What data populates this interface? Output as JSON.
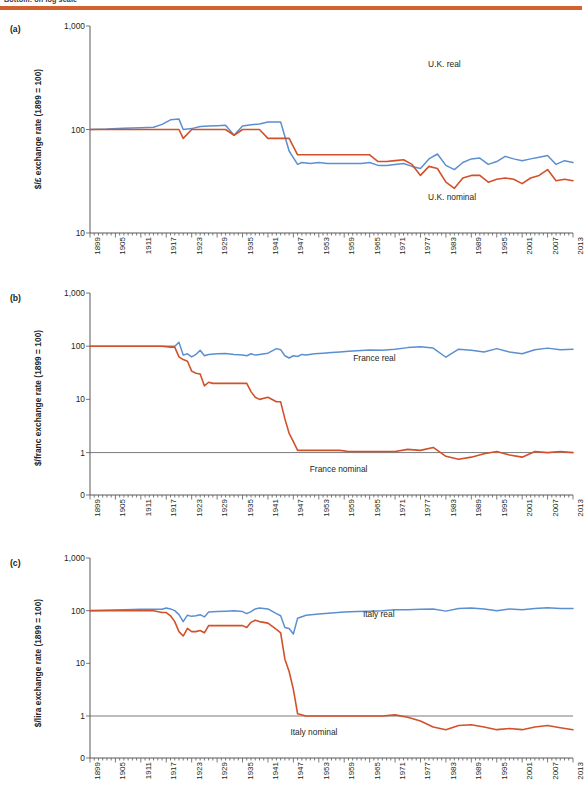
{
  "header": {
    "caption": "Bottom: on log scale",
    "rule_color": "#d2622f"
  },
  "colors": {
    "real": "#5b8fd0",
    "nominal": "#d2502a",
    "axis": "#58595b",
    "text": "#231f20"
  },
  "panels": [
    {
      "tag": "(a)",
      "ylabel": "$/£ exchange rate (1899 = 100)",
      "yticks": [
        "1,000",
        "100",
        "10"
      ],
      "real_label": "U.K. real",
      "nominal_label": "U.K. nominal"
    },
    {
      "tag": "(b)",
      "ylabel": "$/franc exchange rate (1899 = 100)",
      "yticks": [
        "1,000",
        "100",
        "10",
        "1",
        "0"
      ],
      "real_label": "France real",
      "nominal_label": "France nominal"
    },
    {
      "tag": "(c)",
      "ylabel": "$/lira exchange rate (1899 = 100)",
      "yticks": [
        "1,000",
        "100",
        "10",
        "1",
        "0"
      ],
      "real_label": "Italy real",
      "nominal_label": "Italy nominal"
    }
  ],
  "xticks": [
    "1899",
    "1905",
    "1911",
    "1917",
    "1923",
    "1929",
    "1935",
    "1941",
    "1947",
    "1953",
    "1959",
    "1965",
    "1971",
    "1977",
    "1983",
    "1989",
    "1995",
    "2001",
    "2007",
    "2013"
  ],
  "chart_data": {
    "type": "line",
    "xlabel": "",
    "x_start": 1899,
    "x_end": 2013,
    "x_tick_step": 6,
    "grid": false,
    "legend": "inline annotations",
    "panels": [
      {
        "id": "a",
        "tag": "(a)",
        "ylabel": "$/£ exchange rate (1899 = 100)",
        "yscale": "log",
        "yticks": [
          10,
          100,
          1000
        ],
        "ylim": [
          10,
          1000
        ],
        "series": [
          {
            "name": "U.K. real",
            "color": "#5b8fd0",
            "x": [
              1899,
              1903,
              1907,
              1911,
              1914,
              1916,
              1918,
              1920,
              1921,
              1923,
              1925,
              1927,
              1929,
              1931,
              1933,
              1935,
              1937,
              1939,
              1941,
              1944,
              1946,
              1948,
              1949,
              1951,
              1953,
              1955,
              1957,
              1959,
              1961,
              1963,
              1965,
              1967,
              1969,
              1971,
              1973,
              1975,
              1977,
              1979,
              1981,
              1983,
              1985,
              1987,
              1989,
              1991,
              1993,
              1995,
              1997,
              1999,
              2001,
              2003,
              2005,
              2007,
              2009,
              2011,
              2013
            ],
            "values": [
              100,
              101,
              103,
              104,
              105,
              112,
              124,
              126,
              100,
              102,
              107,
              108,
              109,
              110,
              88,
              108,
              111,
              113,
              118,
              118,
              62,
              46,
              48,
              47,
              48,
              47,
              47,
              47,
              47,
              47,
              48,
              45,
              45,
              46,
              47,
              44,
              42,
              52,
              58,
              45,
              41,
              48,
              52,
              53,
              46,
              49,
              55,
              52,
              50,
              52,
              54,
              56,
              46,
              50,
              48
            ]
          },
          {
            "name": "U.K. nominal",
            "color": "#d2502a",
            "x": [
              1899,
              1903,
              1907,
              1911,
              1914,
              1916,
              1918,
              1920,
              1921,
              1923,
              1925,
              1927,
              1929,
              1931,
              1933,
              1935,
              1937,
              1939,
              1941,
              1944,
              1946,
              1948,
              1949,
              1951,
              1953,
              1955,
              1957,
              1959,
              1961,
              1963,
              1965,
              1967,
              1969,
              1971,
              1973,
              1975,
              1977,
              1979,
              1981,
              1983,
              1985,
              1987,
              1989,
              1991,
              1993,
              1995,
              1997,
              1999,
              2001,
              2003,
              2005,
              2007,
              2009,
              2011,
              2013
            ],
            "values": [
              100,
              100,
              100,
              100,
              100,
              100,
              100,
              100,
              82,
              100,
              100,
              100,
              100,
              100,
              88,
              100,
              100,
              100,
              82,
              82,
              82,
              57,
              57,
              57,
              57,
              57,
              57,
              57,
              57,
              57,
              57,
              49,
              49,
              50,
              51,
              46,
              36,
              44,
              42,
              31,
              27,
              34,
              36,
              36,
              31,
              33,
              34,
              33,
              30,
              34,
              36,
              41,
              32,
              33,
              32
            ]
          }
        ]
      },
      {
        "id": "b",
        "tag": "(b)",
        "ylabel": "$/franc exchange rate (1899 = 100)",
        "yscale": "log",
        "yticks": [
          1,
          10,
          100,
          1000
        ],
        "ylim": [
          1,
          1000
        ],
        "series": [
          {
            "name": "France real",
            "color": "#5b8fd0",
            "x": [
              1899,
              1903,
              1907,
              1911,
              1914,
              1916,
              1918,
              1919,
              1920,
              1921,
              1922,
              1923,
              1924,
              1925,
              1926,
              1927,
              1929,
              1931,
              1933,
              1935,
              1936,
              1937,
              1938,
              1939,
              1941,
              1943,
              1944,
              1945,
              1946,
              1947,
              1948,
              1949,
              1950,
              1952,
              1954,
              1956,
              1958,
              1960,
              1962,
              1965,
              1968,
              1971,
              1974,
              1977,
              1980,
              1983,
              1986,
              1989,
              1992,
              1995,
              1998,
              2001,
              2004,
              2007,
              2010,
              2013
            ],
            "values": [
              100,
              100,
              100,
              100,
              100,
              100,
              100,
              100,
              118,
              68,
              72,
              63,
              70,
              84,
              66,
              70,
              72,
              73,
              70,
              68,
              66,
              72,
              68,
              70,
              74,
              90,
              86,
              66,
              60,
              66,
              64,
              70,
              68,
              72,
              74,
              76,
              78,
              80,
              82,
              85,
              84,
              88,
              94,
              98,
              92,
              62,
              88,
              84,
              78,
              90,
              78,
              72,
              86,
              92,
              86,
              88
            ]
          },
          {
            "name": "France nominal",
            "color": "#d2502a",
            "x": [
              1899,
              1903,
              1907,
              1911,
              1914,
              1916,
              1918,
              1919,
              1920,
              1921,
              1922,
              1923,
              1924,
              1925,
              1926,
              1927,
              1928,
              1929,
              1931,
              1933,
              1935,
              1936,
              1937,
              1938,
              1939,
              1941,
              1943,
              1944,
              1945,
              1946,
              1947,
              1948,
              1949,
              1950,
              1952,
              1954,
              1956,
              1958,
              1960,
              1962,
              1965,
              1968,
              1971,
              1974,
              1977,
              1980,
              1983,
              1986,
              1989,
              1992,
              1995,
              1998,
              2001,
              2004,
              2007,
              2010,
              2013
            ],
            "values": [
              100,
              100,
              100,
              100,
              100,
              100,
              96,
              96,
              63,
              56,
              52,
              34,
              31,
              30,
              18,
              21,
              20,
              20,
              20,
              20,
              20,
              20,
              14,
              11,
              10,
              11,
              9,
              9,
              4.3,
              2.3,
              1.6,
              1.1,
              1.1,
              1.1,
              1.1,
              1.1,
              1.1,
              1.1,
              1.05,
              1.05,
              1.05,
              1.05,
              1.05,
              1.15,
              1.1,
              1.25,
              0.85,
              0.75,
              0.82,
              0.95,
              1.05,
              0.9,
              0.82,
              1.05,
              1.0,
              1.05,
              1.0
            ]
          }
        ]
      },
      {
        "id": "c",
        "tag": "(c)",
        "ylabel": "$/lira exchange rate (1899 = 100)",
        "yscale": "log",
        "yticks": [
          1,
          10,
          100,
          1000
        ],
        "ylim": [
          1,
          1000
        ],
        "series": [
          {
            "name": "Italy real",
            "color": "#5b8fd0",
            "x": [
              1899,
              1903,
              1907,
              1911,
              1914,
              1916,
              1917,
              1918,
              1919,
              1920,
              1921,
              1922,
              1923,
              1924,
              1925,
              1926,
              1927,
              1929,
              1931,
              1933,
              1935,
              1936,
              1937,
              1938,
              1939,
              1941,
              1943,
              1944,
              1945,
              1946,
              1947,
              1948,
              1950,
              1953,
              1956,
              1959,
              1962,
              1965,
              1968,
              1971,
              1974,
              1977,
              1980,
              1983,
              1986,
              1989,
              1992,
              1995,
              1998,
              2001,
              2004,
              2007,
              2010,
              2013
            ],
            "values": [
              100,
              102,
              104,
              106,
              106,
              106,
              112,
              108,
              100,
              84,
              62,
              82,
              78,
              80,
              84,
              76,
              94,
              96,
              98,
              100,
              96,
              88,
              96,
              108,
              112,
              108,
              88,
              80,
              48,
              46,
              36,
              72,
              82,
              86,
              90,
              94,
              96,
              98,
              100,
              104,
              104,
              106,
              108,
              98,
              110,
              112,
              108,
              100,
              108,
              104,
              110,
              114,
              110,
              110
            ]
          },
          {
            "name": "Italy nominal",
            "color": "#d2502a",
            "x": [
              1899,
              1903,
              1907,
              1911,
              1914,
              1916,
              1917,
              1918,
              1919,
              1920,
              1921,
              1922,
              1923,
              1924,
              1925,
              1926,
              1927,
              1929,
              1931,
              1933,
              1935,
              1936,
              1937,
              1938,
              1939,
              1941,
              1943,
              1944,
              1945,
              1946,
              1947,
              1948,
              1950,
              1953,
              1956,
              1959,
              1962,
              1965,
              1968,
              1971,
              1974,
              1977,
              1980,
              1983,
              1986,
              1989,
              1992,
              1995,
              1998,
              2001,
              2004,
              2007,
              2010,
              2013
            ],
            "values": [
              100,
              100,
              100,
              100,
              100,
              92,
              92,
              80,
              62,
              40,
              33,
              46,
              40,
              40,
              42,
              38,
              52,
              52,
              52,
              52,
              52,
              48,
              60,
              66,
              62,
              58,
              44,
              38,
              12,
              7,
              3.2,
              1.1,
              1.0,
              1.0,
              1.0,
              1.0,
              1.0,
              1.0,
              1.0,
              1.05,
              0.95,
              0.8,
              0.62,
              0.52,
              0.66,
              0.68,
              0.62,
              0.5,
              0.58,
              0.52,
              0.62,
              0.66,
              0.6,
              0.52
            ]
          }
        ]
      }
    ]
  }
}
